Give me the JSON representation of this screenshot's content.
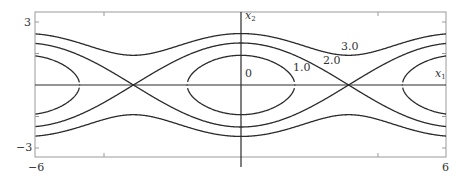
{
  "figure": {
    "type": "phase_portrait",
    "x_range": [
      -6,
      6
    ],
    "y_range": [
      -3.4,
      3.5
    ],
    "frame_px": {
      "left": 35,
      "top": 12,
      "right": 446,
      "bottom": 157
    },
    "origin_px": {
      "x": 241,
      "y": 85
    },
    "scale_px": {
      "x": 34.25,
      "y": 21
    },
    "line_color": "#2b2b2b",
    "frame_color": "#9a9a9a",
    "axes": {
      "x_label": "x",
      "x_label_sub": "1",
      "y_label": "x",
      "y_label_sub": "2"
    },
    "tick_labels": {
      "y_top": "3",
      "y_bottom": "−3",
      "x_left": "−6",
      "x_right": "6"
    },
    "x_ticks": [
      -4,
      4
    ],
    "y_ticks": [
      -3,
      -1.5,
      1.5,
      3
    ],
    "level_curves": [
      {
        "label": "0",
        "energy": 0.0,
        "note": "center point (origin) and equivalent centers at ±2π"
      },
      {
        "label": "1.0",
        "energy": 1.0,
        "note": "closed orbit around centers"
      },
      {
        "label": "2.0",
        "energy": 2.0,
        "note": "separatrix through saddles at ±π"
      },
      {
        "label": "3.0",
        "energy": 3.0,
        "note": "rotating (open) trajectories"
      }
    ],
    "curve_labels_px": [
      {
        "text": "0",
        "x": 245,
        "y": 68
      },
      {
        "text": "1.0",
        "x": 293,
        "y": 62
      },
      {
        "text": "2.0",
        "x": 323,
        "y": 55
      },
      {
        "text": "3.0",
        "x": 341,
        "y": 41
      }
    ]
  }
}
